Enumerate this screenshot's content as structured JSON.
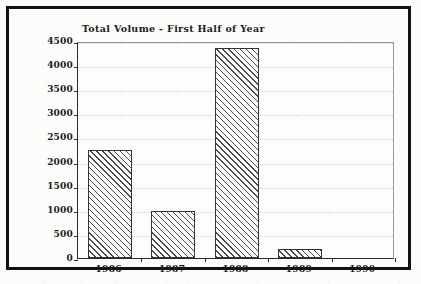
{
  "chart_data": {
    "type": "bar",
    "title": "Total Volume - First Half of Year",
    "xlabel": "",
    "ylabel": "",
    "categories": [
      "1986",
      "1987",
      "1988",
      "1989",
      "1990"
    ],
    "values": [
      2230,
      970,
      4350,
      180,
      0
    ],
    "ylim": [
      0,
      4500
    ],
    "yticks": [
      0,
      500,
      1000,
      1500,
      2000,
      2500,
      3000,
      3500,
      4000,
      4500
    ],
    "ytick_labels": [
      "0",
      "500",
      "1000",
      "1500",
      "2000",
      "2500",
      "3000",
      "3500",
      "4000",
      "4500"
    ],
    "grid": true,
    "legend": "none",
    "bar_fill": "diagonal-hatch",
    "bar_edge_color": "#333333",
    "frame_color": "#111111",
    "gridline_color": "#c9c9c9",
    "series": [
      {
        "name": "Total Volume",
        "values": [
          2230,
          970,
          4350,
          180,
          0
        ]
      }
    ]
  },
  "figure": {
    "title": "Total Volume - First Half of Year",
    "background": "#fcfcfb"
  }
}
